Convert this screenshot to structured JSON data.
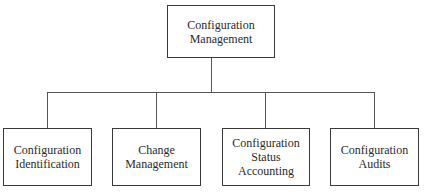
{
  "diagram": {
    "type": "hierarchy",
    "root": {
      "lines": [
        "Configuration",
        "Management"
      ]
    },
    "children": [
      {
        "lines": [
          "Configuration",
          "Identification"
        ]
      },
      {
        "lines": [
          "Change",
          "Management"
        ]
      },
      {
        "lines": [
          "Configuration",
          "Status",
          "Accounting"
        ]
      },
      {
        "lines": [
          "Configuration",
          "Audits"
        ]
      }
    ]
  }
}
